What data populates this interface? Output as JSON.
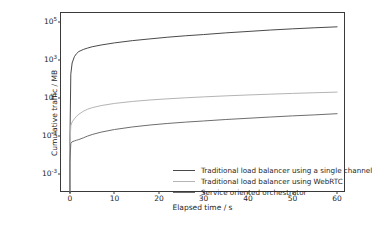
{
  "chart_data": {
    "type": "line",
    "title": "",
    "xlabel": "Elapsed time / s",
    "ylabel": "Cumulative traffic / MB",
    "yscale": "log",
    "xscale": "linear",
    "xlim": [
      -2,
      62
    ],
    "ylim": [
      0.0001,
      300000.0
    ],
    "xticks": [
      0,
      10,
      20,
      30,
      40,
      50,
      60
    ],
    "xticklabels": [
      "0",
      "10",
      "20",
      "30",
      "40",
      "50",
      "60"
    ],
    "yticks": [
      100000.0,
      1000.0,
      10.0,
      0.1,
      0.001
    ],
    "yticklabels": [
      "10^5",
      "10^3",
      "10^1",
      "10^-1",
      "10^-3"
    ],
    "grid": false,
    "legend_position": "lower center-right",
    "x": [
      0,
      0.2,
      0.5,
      1,
      1.5,
      2,
      3,
      4,
      5,
      7,
      10,
      14,
      18,
      22,
      26,
      30,
      35,
      40,
      45,
      50,
      55,
      60
    ],
    "series": [
      {
        "name": "Traditional load balancer using a single channel",
        "color": "#4a4a4a",
        "values": [
          0.05,
          180,
          700,
          1500,
          2200,
          2800,
          3600,
          4300,
          5000,
          6200,
          8000,
          10500,
          13000,
          16000,
          19000,
          22000,
          27000,
          32000,
          38000,
          44000,
          50000,
          56000
        ]
      },
      {
        "name": "Traditional load balancer using WebRTC",
        "color": "#b4b4b4",
        "values": [
          0.03,
          0.35,
          0.55,
          0.8,
          1.1,
          1.4,
          2.0,
          2.6,
          3.1,
          4.0,
          5.2,
          6.6,
          7.9,
          9.1,
          10.3,
          11.5,
          13.0,
          14.5,
          16.0,
          17.5,
          19.0,
          20.5
        ]
      },
      {
        "name": "Service oriented orchestrator",
        "color": "#6e6e6e",
        "values": [
          0.004,
          0.04,
          0.05,
          0.055,
          0.06,
          0.065,
          0.08,
          0.1,
          0.12,
          0.16,
          0.22,
          0.3,
          0.38,
          0.46,
          0.54,
          0.62,
          0.74,
          0.86,
          1.0,
          1.15,
          1.3,
          1.5
        ]
      }
    ]
  }
}
